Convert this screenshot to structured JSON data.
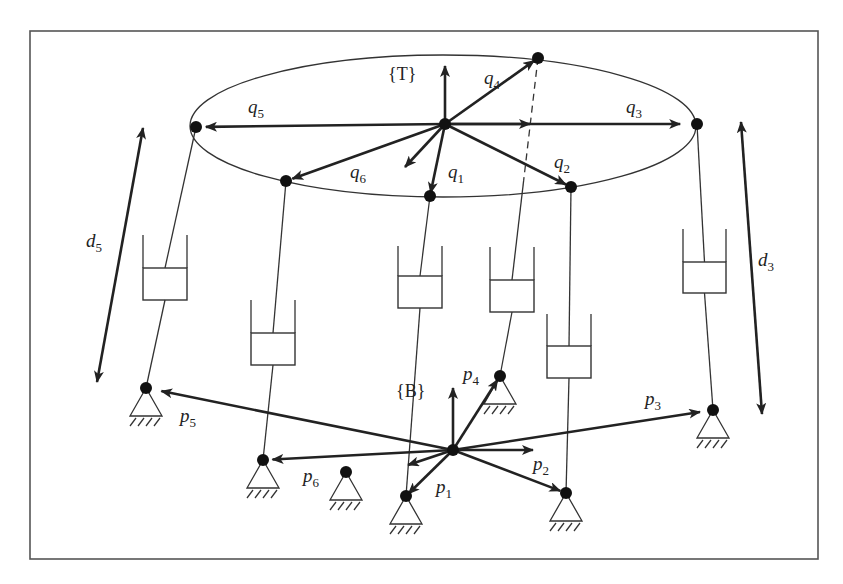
{
  "figure": {
    "frame_top_label": "{T}",
    "frame_base_label": "{B}",
    "colors": {
      "ink": "#222222",
      "background": "#ffffff",
      "frame_border": "#555555"
    }
  },
  "top_platform": {
    "origin": [
      445,
      124
    ],
    "ellipse": {
      "cx": 443,
      "cy": 126,
      "rx": 253,
      "ry": 71
    },
    "vectors": [
      {
        "name": "q1",
        "sym": "q",
        "sub": "1",
        "point": [
          430,
          196
        ],
        "label_pos": [
          448,
          178
        ]
      },
      {
        "name": "q2",
        "sym": "q",
        "sub": "2",
        "point": [
          571,
          187
        ],
        "label_pos": [
          554,
          168
        ]
      },
      {
        "name": "q3",
        "sym": "q",
        "sub": "3",
        "point": [
          690,
          124
        ],
        "label_pos": [
          626,
          113
        ]
      },
      {
        "name": "q4",
        "sym": "q",
        "sub": "4",
        "point": [
          538,
          58
        ],
        "label_pos": [
          484,
          84
        ]
      },
      {
        "name": "q5",
        "sym": "q",
        "sub": "5",
        "point": [
          196,
          127
        ],
        "label_pos": [
          248,
          113
        ]
      },
      {
        "name": "q6",
        "sym": "q",
        "sub": "6",
        "point": [
          286,
          181
        ],
        "label_pos": [
          350,
          178
        ]
      }
    ]
  },
  "base_platform": {
    "origin": [
      453,
      450
    ],
    "vectors": [
      {
        "name": "p1",
        "sym": "p",
        "sub": "1",
        "point": [
          406,
          496
        ],
        "label_pos": [
          436,
          493
        ]
      },
      {
        "name": "p2",
        "sym": "p",
        "sub": "2",
        "point": [
          566,
          493
        ],
        "label_pos": [
          533,
          470
        ]
      },
      {
        "name": "p3",
        "sym": "p",
        "sub": "3",
        "point": [
          713,
          410
        ],
        "label_pos": [
          645,
          405
        ]
      },
      {
        "name": "p4",
        "sym": "p",
        "sub": "4",
        "point": [
          500,
          376
        ],
        "label_pos": [
          463,
          380
        ]
      },
      {
        "name": "p5",
        "sym": "p",
        "sub": "5",
        "point": [
          146,
          388
        ],
        "label_pos": [
          180,
          422
        ]
      },
      {
        "name": "p6",
        "sym": "p",
        "sub": "6",
        "point": [
          263,
          460
        ],
        "label_pos": [
          303,
          482
        ]
      }
    ],
    "extra_support": [
      346,
      472
    ]
  },
  "legs": [
    {
      "id": 1,
      "top": [
        430,
        196
      ],
      "bottom": [
        406,
        496
      ],
      "cyl": {
        "x": 398,
        "y": 276,
        "w": 44,
        "h": 32,
        "wall": 30
      }
    },
    {
      "id": 2,
      "top": [
        571,
        187
      ],
      "bottom": [
        566,
        493
      ],
      "cyl": {
        "x": 547,
        "y": 346,
        "w": 44,
        "h": 32,
        "wall": 32
      }
    },
    {
      "id": 3,
      "top": [
        697,
        124
      ],
      "bottom": [
        713,
        410
      ],
      "cyl": {
        "x": 683,
        "y": 262,
        "w": 43,
        "h": 31,
        "wall": 33
      }
    },
    {
      "id": 4,
      "top": [
        538,
        58
      ],
      "bottom": [
        500,
        376
      ],
      "cyl": {
        "x": 490,
        "y": 280,
        "w": 44,
        "h": 32,
        "wall": 33
      },
      "upper_dashed": true
    },
    {
      "id": 5,
      "top": [
        196,
        127
      ],
      "bottom": [
        146,
        388
      ],
      "cyl": {
        "x": 143,
        "y": 268,
        "w": 44,
        "h": 32,
        "wall": 33
      }
    },
    {
      "id": 6,
      "top": [
        286,
        181
      ],
      "bottom": [
        263,
        460
      ],
      "cyl": {
        "x": 251,
        "y": 333,
        "w": 44,
        "h": 32,
        "wall": 33
      }
    }
  ],
  "length_arrows": [
    {
      "name": "d5",
      "sym": "d",
      "sub": "5",
      "from": [
        97,
        382
      ],
      "to": [
        143,
        128
      ],
      "label_pos": [
        86,
        247
      ]
    },
    {
      "name": "d3",
      "sym": "d",
      "sub": "3",
      "from": [
        762,
        414
      ],
      "to": [
        741,
        122
      ],
      "label_pos": [
        758,
        266
      ]
    }
  ],
  "frame": {
    "x": 30,
    "y": 31,
    "w": 788,
    "h": 528
  }
}
